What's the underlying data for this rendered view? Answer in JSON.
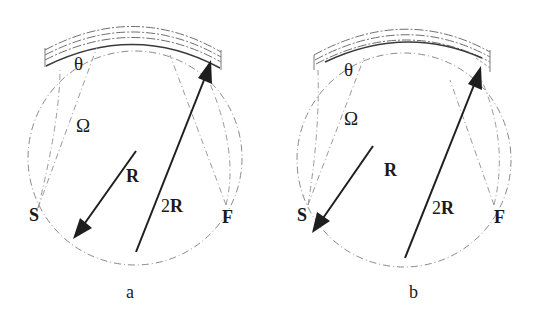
{
  "figure": {
    "panels": [
      {
        "id": "a",
        "caption": "a",
        "labels": {
          "theta": "θ",
          "omega": "Ω",
          "source": "S",
          "focus": "F",
          "radius": "R",
          "diameter": "2R"
        }
      },
      {
        "id": "b",
        "caption": "b",
        "labels": {
          "theta": "θ",
          "omega": "Ω",
          "source": "S",
          "focus": "F",
          "radius": "R",
          "diameter": "2R"
        }
      }
    ],
    "colors": {
      "ink": "#1e1e1e",
      "construction_lines": "#8a8a8a",
      "background": "#ffffff"
    }
  }
}
